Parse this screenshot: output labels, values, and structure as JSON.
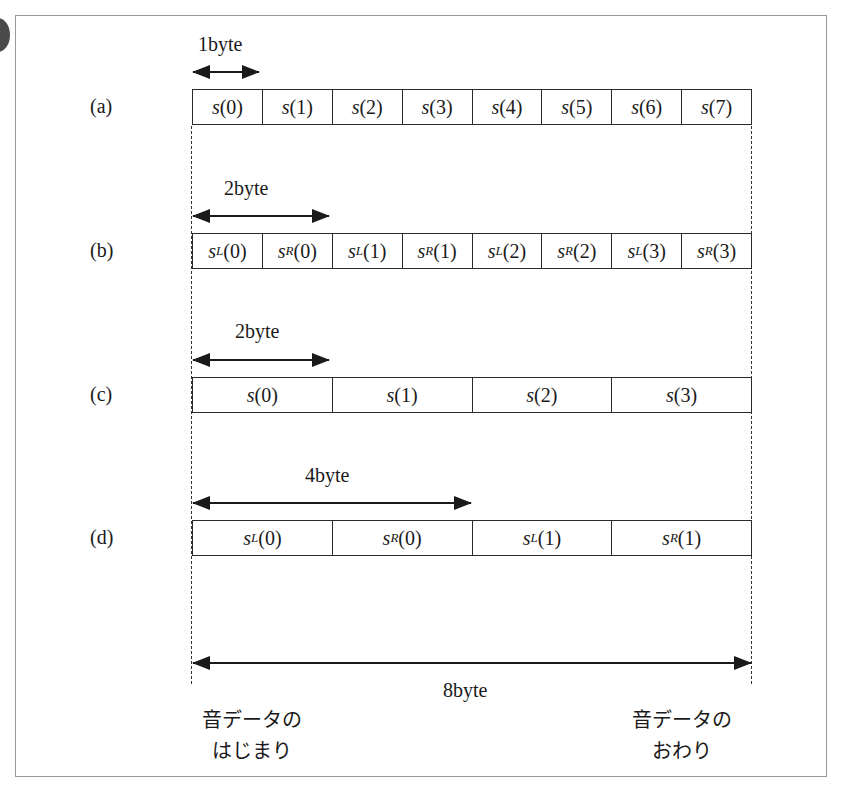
{
  "figure": {
    "rows": [
      {
        "label": "(a)",
        "size_label": "1byte",
        "cells": [
          {
            "base": "s",
            "sub": "",
            "index": "(0)"
          },
          {
            "base": "s",
            "sub": "",
            "index": "(1)"
          },
          {
            "base": "s",
            "sub": "",
            "index": "(2)"
          },
          {
            "base": "s",
            "sub": "",
            "index": "(3)"
          },
          {
            "base": "s",
            "sub": "",
            "index": "(4)"
          },
          {
            "base": "s",
            "sub": "",
            "index": "(5)"
          },
          {
            "base": "s",
            "sub": "",
            "index": "(6)"
          },
          {
            "base": "s",
            "sub": "",
            "index": "(7)"
          }
        ]
      },
      {
        "label": "(b)",
        "size_label": "2byte",
        "cells": [
          {
            "base": "s",
            "sub": "L",
            "index": "(0)"
          },
          {
            "base": "s",
            "sub": "R",
            "index": "(0)"
          },
          {
            "base": "s",
            "sub": "L",
            "index": "(1)"
          },
          {
            "base": "s",
            "sub": "R",
            "index": "(1)"
          },
          {
            "base": "s",
            "sub": "L",
            "index": "(2)"
          },
          {
            "base": "s",
            "sub": "R",
            "index": "(2)"
          },
          {
            "base": "s",
            "sub": "L",
            "index": "(3)"
          },
          {
            "base": "s",
            "sub": "R",
            "index": "(3)"
          }
        ]
      },
      {
        "label": "(c)",
        "size_label": "2byte",
        "cells": [
          {
            "base": "s",
            "sub": "",
            "index": "(0)"
          },
          {
            "base": "s",
            "sub": "",
            "index": "(1)"
          },
          {
            "base": "s",
            "sub": "",
            "index": "(2)"
          },
          {
            "base": "s",
            "sub": "",
            "index": "(3)"
          }
        ]
      },
      {
        "label": "(d)",
        "size_label": "4byte",
        "cells": [
          {
            "base": "s",
            "sub": "L",
            "index": "(0)"
          },
          {
            "base": "s",
            "sub": "R",
            "index": "(0)"
          },
          {
            "base": "s",
            "sub": "L",
            "index": "(1)"
          },
          {
            "base": "s",
            "sub": "R",
            "index": "(1)"
          }
        ]
      }
    ],
    "total": {
      "size_label": "8byte"
    },
    "start_label": {
      "line1": "音データの",
      "line2": "はじまり"
    },
    "end_label": {
      "line1": "音データの",
      "line2": "おわり"
    }
  }
}
